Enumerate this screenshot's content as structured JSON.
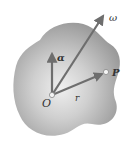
{
  "figure": {
    "labels": {
      "origin": "O",
      "angular_velocity": "ω",
      "angular_acceleration": "α",
      "point": "P",
      "position_vector": "r"
    },
    "colors": {
      "body_fill": "#a9a9a9",
      "body_highlight": "#ececec",
      "vector": "#6e6e6e"
    }
  }
}
